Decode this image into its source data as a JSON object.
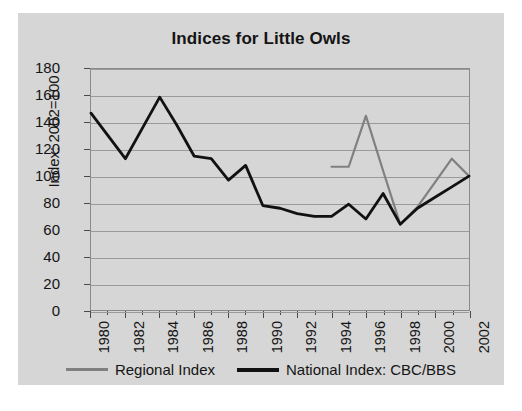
{
  "chart_data": {
    "type": "line",
    "title": "Indices for Little Owls",
    "xlabel": "",
    "ylabel": "Index: 2002=100",
    "xlim": [
      1980,
      2002
    ],
    "ylim": [
      0,
      180
    ],
    "ytick_step": 20,
    "yticks": [
      180,
      160,
      140,
      120,
      100,
      80,
      60,
      40,
      20,
      0
    ],
    "xticks": [
      1980,
      1982,
      1984,
      1986,
      1988,
      1990,
      1992,
      1994,
      1996,
      1998,
      2000,
      2002
    ],
    "x_minor_ticks": [
      1981,
      1983,
      1985,
      1987,
      1989,
      1991,
      1993,
      1995,
      1997,
      1999,
      2001
    ],
    "x": [
      1980,
      1981,
      1982,
      1983,
      1984,
      1985,
      1986,
      1987,
      1988,
      1989,
      1990,
      1991,
      1992,
      1993,
      1994,
      1995,
      1996,
      1997,
      1998,
      1999,
      2000,
      2001,
      2002
    ],
    "grid": true,
    "legend_position": "bottom",
    "series": [
      {
        "name": "Regional Index",
        "color": "#808080",
        "x": [
          1994,
          1995,
          1996,
          1997,
          1998,
          1999,
          2000,
          2001,
          2002
        ],
        "values": [
          107,
          107,
          145,
          104,
          64,
          77,
          95,
          113,
          100
        ]
      },
      {
        "name": "National Index: CBC/BBS",
        "color": "#111111",
        "x": [
          1980,
          1981,
          1982,
          1983,
          1984,
          1985,
          1986,
          1987,
          1988,
          1989,
          1990,
          1991,
          1992,
          1993,
          1994,
          1995,
          1996,
          1997,
          1998,
          1999,
          2000,
          2001,
          2002
        ],
        "values": [
          147,
          130,
          113,
          136,
          159,
          138,
          115,
          113,
          97,
          108,
          78,
          76,
          72,
          70,
          70,
          79,
          68,
          87,
          64,
          76,
          84,
          92,
          100
        ]
      }
    ]
  },
  "legend": {
    "entries": [
      {
        "label": "Regional Index"
      },
      {
        "label": "National Index: CBC/BBS"
      }
    ]
  }
}
